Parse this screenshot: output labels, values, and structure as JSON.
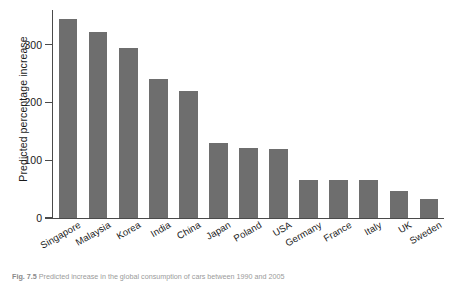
{
  "chart_data": {
    "type": "bar",
    "title": "",
    "xlabel": "",
    "ylabel": "Predicted percentage increase",
    "ylim": [
      0,
      360
    ],
    "yticks": [
      0,
      100,
      200,
      300
    ],
    "ytick_labels": [
      "0",
      "100",
      "200",
      "300"
    ],
    "grid": false,
    "legend": null,
    "bar_color": "#6e6e6e",
    "background_color": "#ffffff",
    "axis_color": "#4a4a4a",
    "categories": [
      "Singapore",
      "Malaysia",
      "Korea",
      "India",
      "China",
      "Japan",
      "Poland",
      "USA",
      "Germany",
      "France",
      "Italy",
      "UK",
      "Sweden"
    ],
    "values": [
      345,
      322,
      295,
      240,
      219,
      129,
      121,
      119,
      66,
      66,
      65,
      47,
      33
    ]
  },
  "caption": {
    "figure_number": "Fig. 7.5",
    "text": "Predicted increase in the global consumption of cars between 1990 and 2005"
  }
}
